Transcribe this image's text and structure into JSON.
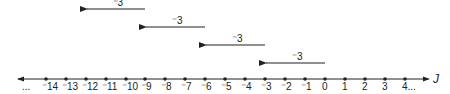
{
  "diagram": {
    "type": "number-line",
    "axis_label": "J",
    "left_ellipsis": "...",
    "right_ellipsis": "...",
    "colors": {
      "ink": "#222222",
      "background": "#ffffff"
    },
    "points": [
      {
        "value": -14,
        "label": "⁻14",
        "x": 46
      },
      {
        "value": -13,
        "label": "⁻13",
        "x": 66
      },
      {
        "value": -12,
        "label": "⁻12",
        "x": 86
      },
      {
        "value": -11,
        "label": "⁻11",
        "x": 106
      },
      {
        "value": -10,
        "label": "⁻10",
        "x": 126
      },
      {
        "value": -9,
        "label": "⁻9",
        "x": 145
      },
      {
        "value": -8,
        "label": "⁻8",
        "x": 165
      },
      {
        "value": -7,
        "label": "⁻7",
        "x": 185
      },
      {
        "value": -6,
        "label": "⁻6",
        "x": 205
      },
      {
        "value": -5,
        "label": "⁻5",
        "x": 225
      },
      {
        "value": -4,
        "label": "⁻4",
        "x": 245
      },
      {
        "value": -3,
        "label": "⁻3",
        "x": 265
      },
      {
        "value": -2,
        "label": "⁻2",
        "x": 285
      },
      {
        "value": -1,
        "label": "⁻1",
        "x": 305
      },
      {
        "value": 0,
        "label": "0",
        "x": 325
      },
      {
        "value": 1,
        "label": "1",
        "x": 345
      },
      {
        "value": 2,
        "label": "2",
        "x": 365
      },
      {
        "value": 3,
        "label": "3",
        "x": 385
      },
      {
        "value": 4,
        "label": "4",
        "x": 405
      }
    ],
    "jumps": [
      {
        "label": "⁻3",
        "from": -9,
        "to": -12,
        "y": 9
      },
      {
        "label": "⁻3",
        "from": -6,
        "to": -9,
        "y": 27
      },
      {
        "label": "⁻3",
        "from": -3,
        "to": -6,
        "y": 45
      },
      {
        "label": "⁻3",
        "from": 0,
        "to": -3,
        "y": 63
      }
    ]
  }
}
